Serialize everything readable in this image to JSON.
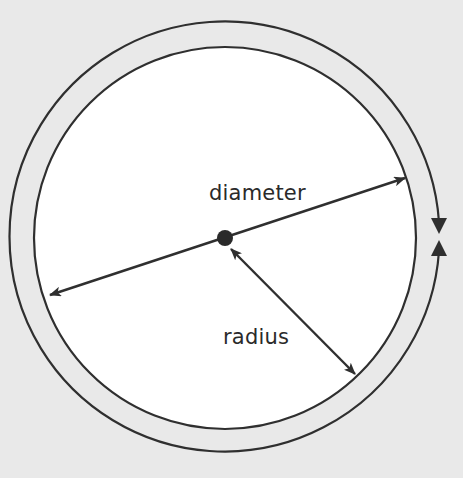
{
  "diagram": {
    "labels": {
      "diameter": "diameter",
      "radius": "radius"
    },
    "colors": {
      "background": "#e9e9e9",
      "circle_fill": "#ffffff",
      "stroke": "#2f2f2f",
      "text": "#2a2a2a"
    },
    "elements": [
      {
        "name": "inner-circle",
        "type": "circle",
        "meaning": "circle"
      },
      {
        "name": "center-point",
        "type": "dot"
      },
      {
        "name": "diameter-line",
        "type": "double-arrow",
        "label": "diameter"
      },
      {
        "name": "radius-line",
        "type": "double-arrow",
        "label": "radius"
      },
      {
        "name": "circumference-arc",
        "type": "arc-with-arrowheads",
        "label": ""
      }
    ]
  }
}
